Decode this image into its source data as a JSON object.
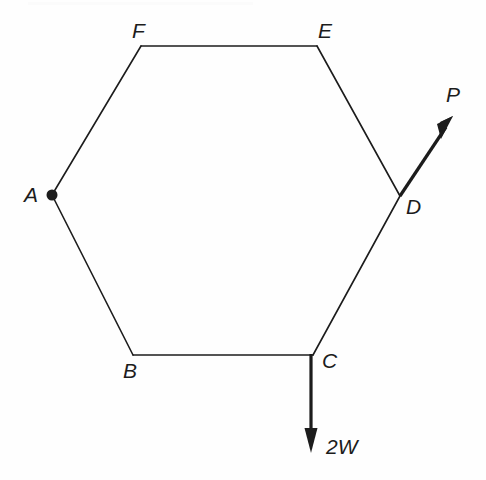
{
  "figure": {
    "type": "free-body-diagram",
    "shape": "regular-hexagon",
    "canvas": {
      "width": 486,
      "height": 480
    },
    "stroke_color": "#1c1c1c",
    "background_color": "#fefefe",
    "thin_stroke_width": 1.6,
    "thick_stroke_width": 3.2,
    "vertices": [
      {
        "id": "A",
        "label": "A",
        "x": 52,
        "y": 195,
        "label_x": 24,
        "label_y": 184,
        "has_pivot_dot": true
      },
      {
        "id": "B",
        "label": "B",
        "x": 133,
        "y": 355,
        "label_x": 123,
        "label_y": 360,
        "has_pivot_dot": false
      },
      {
        "id": "C",
        "label": "C",
        "x": 313,
        "y": 355,
        "label_x": 322,
        "label_y": 350,
        "has_pivot_dot": false
      },
      {
        "id": "D",
        "label": "D",
        "x": 400,
        "y": 196,
        "label_x": 406,
        "label_y": 196,
        "has_pivot_dot": false
      },
      {
        "id": "E",
        "label": "E",
        "x": 317,
        "y": 46,
        "label_x": 318,
        "label_y": 20,
        "has_pivot_dot": false
      },
      {
        "id": "F",
        "label": "F",
        "x": 141,
        "y": 46,
        "label_x": 132,
        "label_y": 20,
        "has_pivot_dot": false
      }
    ],
    "edges": [
      {
        "name": "edge-AF",
        "from": "A",
        "to": "F"
      },
      {
        "name": "edge-FE",
        "from": "F",
        "to": "E"
      },
      {
        "name": "edge-ED",
        "from": "E",
        "to": "D"
      },
      {
        "name": "edge-DC",
        "from": "D",
        "to": "C"
      },
      {
        "name": "edge-CB",
        "from": "C",
        "to": "B"
      },
      {
        "name": "edge-BA",
        "from": "B",
        "to": "A"
      }
    ],
    "pivot": {
      "name": "pivot-at-A",
      "at_vertex": "A",
      "radius": 5.5
    },
    "forces": [
      {
        "id": "P",
        "label": "P",
        "applied_at": "D",
        "description": "force along line CD extended beyond D",
        "start_x": 400,
        "start_y": 196,
        "tip_x": 452,
        "tip_y": 118,
        "label_x": 446,
        "label_y": 84,
        "arrow_head_length": 20,
        "arrow_head_width": 11
      },
      {
        "id": "2W",
        "label": "2W",
        "applied_at": "C",
        "description": "downward load at C",
        "start_x": 311,
        "start_y": 355,
        "tip_x": 311,
        "tip_y": 452,
        "label_x": 326,
        "label_y": 436,
        "arrow_head_length": 22,
        "arrow_head_width": 12
      }
    ]
  }
}
